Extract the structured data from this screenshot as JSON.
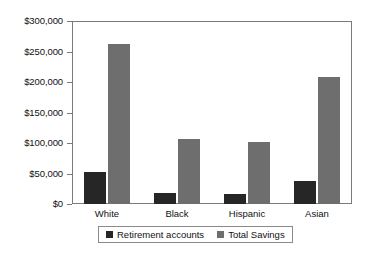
{
  "chart_data": {
    "type": "bar",
    "title": "",
    "xlabel": "",
    "ylabel": "",
    "categories": [
      "White",
      "Black",
      "Hispanic",
      "Asian"
    ],
    "series": [
      {
        "name": "Retirement accounts",
        "color": "#262626",
        "values": [
          52000,
          18000,
          16000,
          38000
        ]
      },
      {
        "name": "Total Savings",
        "color": "#6e6e6e",
        "values": [
          262000,
          107000,
          102000,
          208000
        ]
      }
    ],
    "ylim": [
      0,
      300000
    ],
    "y_ticks": [
      0,
      50000,
      100000,
      150000,
      200000,
      250000,
      300000
    ],
    "y_tick_labels": [
      "$0",
      "$50,000",
      "$100,000",
      "$150,000",
      "$200,000",
      "$250,000",
      "$300,000"
    ],
    "grid": false,
    "legend_position": "bottom"
  },
  "legend": {
    "items": [
      {
        "label": "Retirement accounts",
        "swatch": "retirement"
      },
      {
        "label": "Total Savings",
        "swatch": "savings"
      }
    ]
  }
}
